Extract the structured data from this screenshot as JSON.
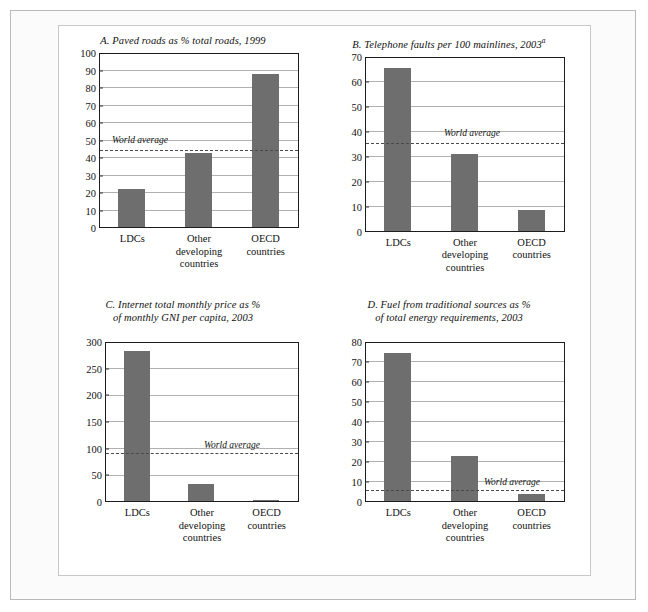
{
  "figure": {
    "background_color": "#ffffff",
    "bar_color": "#6e6e6e",
    "average_line_color": "#4a4a4a",
    "grid_color": "#b0b0b0",
    "axis_color": "#1c1c1c",
    "average_label": "World average"
  },
  "categories": [
    "LDCs",
    "Other\ndeveloping\ncountries",
    "OECD\ncountries"
  ],
  "chart_data": [
    {
      "id": "panel-a",
      "type": "bar",
      "title": "A. Paved roads as % total roads, 1999",
      "title_main": "A. Paved roads as % total roads, 1999",
      "title_superscript": "",
      "categories": [
        "LDCs",
        "Other developing countries",
        "OECD countries"
      ],
      "values": [
        21.5,
        42.5,
        87.5
      ],
      "xlabel": "",
      "ylabel": "",
      "ylim": [
        0,
        100
      ],
      "yticks": [
        0,
        10,
        20,
        30,
        40,
        50,
        60,
        70,
        80,
        90,
        100
      ],
      "ytick_labels": [
        "0",
        "10",
        "20",
        "30",
        "40",
        "50",
        "60",
        "70",
        "80",
        "90",
        "100"
      ],
      "grid": true,
      "annotations": [
        {
          "label": "World average",
          "value": 44.5,
          "style": "dashed-horizontal-line"
        }
      ]
    },
    {
      "id": "panel-b",
      "type": "bar",
      "title": "B. Telephone faults per 100 mainlines, 2003a",
      "title_main": "B. Telephone faults per 100 mainlines, 2003",
      "title_superscript": "a",
      "categories": [
        "LDCs",
        "Other developing countries",
        "OECD countries"
      ],
      "values": [
        65,
        30.5,
        8.2
      ],
      "xlabel": "",
      "ylabel": "",
      "ylim": [
        0,
        70
      ],
      "yticks": [
        0,
        10,
        20,
        30,
        40,
        50,
        60,
        70
      ],
      "ytick_labels": [
        "0",
        "10",
        "20",
        "30",
        "40",
        "50",
        "60",
        "70"
      ],
      "grid": true,
      "annotations": [
        {
          "label": "World average",
          "value": 35.3,
          "style": "dashed-horizontal-line"
        }
      ]
    },
    {
      "id": "panel-c",
      "type": "bar",
      "title": "C. Internet total monthly price as % of monthly GNI per capita, 2003",
      "title_main": "C. Internet total monthly price as %\nof monthly GNI per capita, 2003",
      "title_superscript": "",
      "categories": [
        "LDCs",
        "Other developing countries",
        "OECD countries"
      ],
      "values": [
        282,
        32,
        2
      ],
      "xlabel": "",
      "ylabel": "",
      "ylim": [
        0,
        300
      ],
      "yticks": [
        0,
        50,
        100,
        150,
        200,
        250,
        300
      ],
      "ytick_labels": [
        "0",
        "50",
        "100",
        "150",
        "200",
        "250",
        "300"
      ],
      "grid": true,
      "annotations": [
        {
          "label": "World average",
          "value": 90,
          "style": "dashed-horizontal-line"
        }
      ]
    },
    {
      "id": "panel-d",
      "type": "bar",
      "title": "D. Fuel from traditional sources as % of total energy requirements, 2003",
      "title_main": "D. Fuel from traditional sources as %\nof total energy requirements, 2003",
      "title_superscript": "",
      "categories": [
        "LDCs",
        "Other developing countries",
        "OECD countries"
      ],
      "values": [
        74,
        22.5,
        3.5
      ],
      "xlabel": "",
      "ylabel": "",
      "ylim": [
        0,
        80
      ],
      "yticks": [
        0,
        10,
        20,
        30,
        40,
        50,
        60,
        70,
        80
      ],
      "ytick_labels": [
        "0",
        "10",
        "20",
        "30",
        "40",
        "50",
        "60",
        "70",
        "80"
      ],
      "grid": true,
      "annotations": [
        {
          "label": "World average",
          "value": 5.5,
          "style": "dashed-horizontal-line"
        }
      ]
    }
  ]
}
